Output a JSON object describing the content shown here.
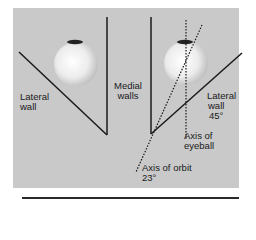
{
  "figure": {
    "labels": {
      "lateral_wall_left": [
        "Lateral",
        "wall"
      ],
      "medial_walls": [
        "Medial",
        "walls"
      ],
      "lateral_wall_right": [
        "Lateral",
        "wall",
        "45°"
      ],
      "axis_of_eyeball": [
        "Axis of",
        "eyeball"
      ],
      "axis_of_orbit": [
        "Axis of orbit",
        "23°"
      ]
    },
    "colors": {
      "panel": "#c9c9c9",
      "lines": "#1a1a1a",
      "eyeball": "#f2f2f2",
      "cornea": "#222222"
    }
  }
}
